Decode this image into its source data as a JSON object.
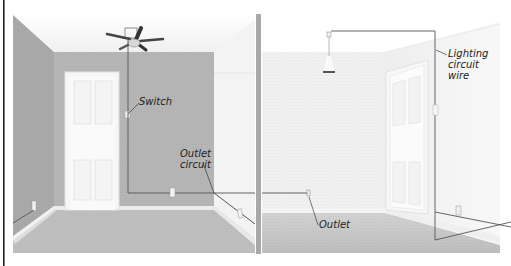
{
  "diagram": {
    "title": "",
    "rooms": [
      {
        "name": "Room with ceiling fan",
        "fixtures": [
          "ceiling-fan",
          "switch",
          "outlets",
          "door"
        ]
      },
      {
        "name": "Room with pendant light",
        "fixtures": [
          "pendant-light",
          "switch",
          "outlets",
          "door"
        ]
      }
    ],
    "labels": {
      "switch": "Switch",
      "outlet_circuit": "Outlet\ncircuit",
      "lighting_circuit_wire": "Lighting\ncircuit\nwire",
      "outlet": "Outlet"
    },
    "colors": {
      "back_wall_left": "#b5b5b5",
      "side_wall_left": "#a9a9a9",
      "floor": "#bdbdbd",
      "wall_right_room": "#f1f1f1",
      "floor_right_room": "#c4c4c4",
      "wire": "#555555",
      "divider": "#a8a8a8",
      "border": "#222222"
    }
  }
}
